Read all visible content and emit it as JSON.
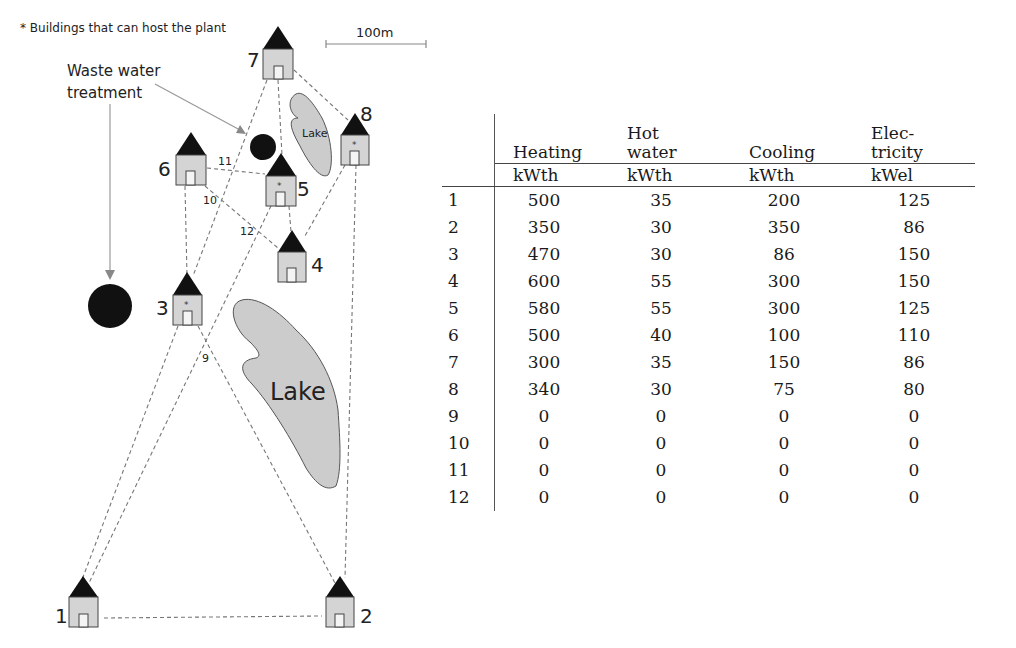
{
  "map": {
    "legend_note": "* Buildings that can host the plant",
    "scale_bar_label": "100m",
    "waste_water_label_line1": "Waste water",
    "waste_water_label_line2": "treatment",
    "lake_small_label": "Lake",
    "lake_large_label": "Lake",
    "buildings": [
      {
        "id": "1",
        "host_plant": false
      },
      {
        "id": "2",
        "host_plant": false
      },
      {
        "id": "3",
        "host_plant": true
      },
      {
        "id": "4",
        "host_plant": false
      },
      {
        "id": "5",
        "host_plant": true
      },
      {
        "id": "6",
        "host_plant": false
      },
      {
        "id": "7",
        "host_plant": false
      },
      {
        "id": "8",
        "host_plant": true
      }
    ],
    "junction_labels": [
      "9",
      "10",
      "11",
      "12"
    ],
    "colors": {
      "building_fill": "#d4d4d4",
      "roof": "#111111",
      "lake_fill": "#cccccc",
      "pipe": "#777777",
      "plant": "#111111"
    }
  },
  "table": {
    "headers": [
      {
        "line1": "Heating",
        "line2": "",
        "unit": "kWth"
      },
      {
        "line1": "Hot",
        "line2": "water",
        "unit": "kWth"
      },
      {
        "line1": "Cooling",
        "line2": "",
        "unit": "kWth"
      },
      {
        "line1": "Elec-",
        "line2": "tricity",
        "unit": "kWel"
      }
    ],
    "rows": [
      {
        "id": "1",
        "heating": "500",
        "hot_water": "35",
        "cooling": "200",
        "electricity": "125"
      },
      {
        "id": "2",
        "heating": "350",
        "hot_water": "30",
        "cooling": "350",
        "electricity": "86"
      },
      {
        "id": "3",
        "heating": "470",
        "hot_water": "30",
        "cooling": "86",
        "electricity": "150"
      },
      {
        "id": "4",
        "heating": "600",
        "hot_water": "55",
        "cooling": "300",
        "electricity": "150"
      },
      {
        "id": "5",
        "heating": "580",
        "hot_water": "55",
        "cooling": "300",
        "electricity": "125"
      },
      {
        "id": "6",
        "heating": "500",
        "hot_water": "40",
        "cooling": "100",
        "electricity": "110"
      },
      {
        "id": "7",
        "heating": "300",
        "hot_water": "35",
        "cooling": "150",
        "electricity": "86"
      },
      {
        "id": "8",
        "heating": "340",
        "hot_water": "30",
        "cooling": "75",
        "electricity": "80"
      },
      {
        "id": "9",
        "heating": "0",
        "hot_water": "0",
        "cooling": "0",
        "electricity": "0"
      },
      {
        "id": "10",
        "heating": "0",
        "hot_water": "0",
        "cooling": "0",
        "electricity": "0"
      },
      {
        "id": "11",
        "heating": "0",
        "hot_water": "0",
        "cooling": "0",
        "electricity": "0"
      },
      {
        "id": "12",
        "heating": "0",
        "hot_water": "0",
        "cooling": "0",
        "electricity": "0"
      }
    ]
  }
}
